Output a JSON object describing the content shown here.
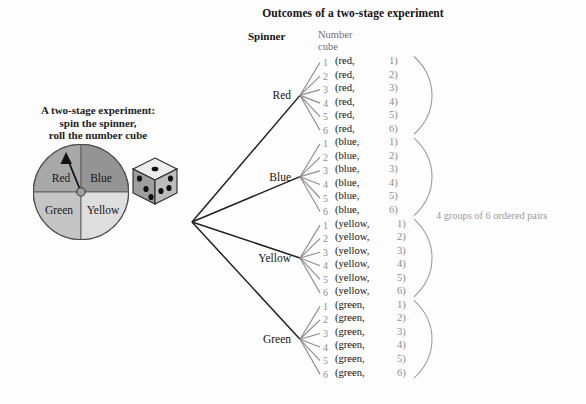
{
  "title": "Outcomes of a two-stage experiment",
  "headers": {
    "spinner": "Spinner",
    "number_cube_line1": "Number",
    "number_cube_line2": "cube"
  },
  "caption": {
    "line1": "A two-stage experiment:",
    "line2": "spin the spinner,",
    "line3": "roll the number cube"
  },
  "spinner": {
    "sectors": [
      {
        "label": "Red",
        "color": "#a8a8a8",
        "position": "top-left"
      },
      {
        "label": "Blue",
        "color": "#949494",
        "position": "top-right"
      },
      {
        "label": "Green",
        "color": "#c5c5c5",
        "position": "bottom-left"
      },
      {
        "label": "Yellow",
        "color": "#dedede",
        "position": "bottom-right"
      }
    ],
    "pointer_direction": "up-left"
  },
  "number_cube": {
    "name": "number-cube",
    "top_face_pips": 1,
    "left_face_pips": 3,
    "right_face_pips": 3
  },
  "tree": {
    "branches": [
      {
        "label": "Red",
        "cube_values": [
          "1",
          "2",
          "3",
          "4",
          "5",
          "6"
        ]
      },
      {
        "label": "Blue",
        "cube_values": [
          "1",
          "2",
          "3",
          "4",
          "5",
          "6"
        ]
      },
      {
        "label": "Yellow",
        "cube_values": [
          "1",
          "2",
          "3",
          "4",
          "5",
          "6"
        ]
      },
      {
        "label": "Green",
        "cube_values": [
          "1",
          "2",
          "3",
          "4",
          "5",
          "6"
        ]
      }
    ]
  },
  "outcomes": [
    {
      "color": "(red,",
      "num": "1)"
    },
    {
      "color": "(red,",
      "num": "2)"
    },
    {
      "color": "(red,",
      "num": "3)"
    },
    {
      "color": "(red,",
      "num": "4)"
    },
    {
      "color": "(red,",
      "num": "5)"
    },
    {
      "color": "(red,",
      "num": "6)"
    },
    {
      "color": "(blue,",
      "num": "1)"
    },
    {
      "color": "(blue,",
      "num": "2)"
    },
    {
      "color": "(blue,",
      "num": "3)"
    },
    {
      "color": "(blue,",
      "num": "4)"
    },
    {
      "color": "(blue,",
      "num": "5)"
    },
    {
      "color": "(blue,",
      "num": "6)"
    },
    {
      "color": "(yellow,",
      "num": "1)"
    },
    {
      "color": "(yellow,",
      "num": "2)"
    },
    {
      "color": "(yellow,",
      "num": "3)"
    },
    {
      "color": "(yellow,",
      "num": "4)"
    },
    {
      "color": "(yellow,",
      "num": "5)"
    },
    {
      "color": "(yellow,",
      "num": "6)"
    },
    {
      "color": "(green,",
      "num": "1)"
    },
    {
      "color": "(green,",
      "num": "2)"
    },
    {
      "color": "(green,",
      "num": "3)"
    },
    {
      "color": "(green,",
      "num": "4)"
    },
    {
      "color": "(green,",
      "num": "5)"
    },
    {
      "color": "(green,",
      "num": "6)"
    }
  ],
  "annotation": "4 groups of 6 ordered pairs",
  "colors": {
    "background": "#fdfdfd",
    "text": "#121212",
    "muted": "#8d8d8d",
    "branch_dark": "#202020",
    "branch_light": "#8e8e8e",
    "bracket": "#9a9a9a"
  }
}
